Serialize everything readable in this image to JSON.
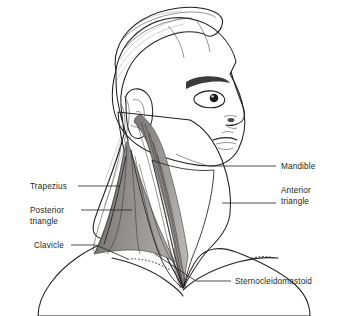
{
  "figure": {
    "orientation": "right lateral profile, facing right",
    "background_color": "#ffffff"
  },
  "palette": {
    "outline": "#231f20",
    "skin": "#eceae8",
    "skin_highlight": "#f7f6f5",
    "hair_mid": "#8a8a8a",
    "hair_dark": "#6e6e6e",
    "muscle_dark": "#5f5f5f",
    "muscle_mid": "#8d8d8d",
    "muscle_light": "#b5b3b1",
    "label_text": "#231f20"
  },
  "labels": [
    {
      "id": "trapezius",
      "text": "Trapezius",
      "side": "left",
      "lines": [
        "Trapezius"
      ],
      "text_x": 30,
      "text_y": 189,
      "leader": "M 78 186 L 120 186"
    },
    {
      "id": "posterior-triangle",
      "text": "Posterior triangle",
      "side": "left",
      "lines": [
        "Posterior",
        "triangle"
      ],
      "text_x": 30,
      "text_y": 213,
      "leader": "M 81 210 L 132 210"
    },
    {
      "id": "clavicle",
      "text": "Clavicle",
      "side": "left",
      "lines": [
        "Clavicle"
      ],
      "text_x": 34,
      "text_y": 248,
      "leader": "M 71 245 L 96 245 L 128 259"
    },
    {
      "id": "mandible",
      "text": "Mandible",
      "side": "right",
      "lines": [
        "Mandible"
      ],
      "text_x": 281,
      "text_y": 169,
      "leader": "M 209 166 L 276 166"
    },
    {
      "id": "anterior-triangle",
      "text": "Anterior triangle",
      "side": "right",
      "lines": [
        "Anterior",
        "triangle"
      ],
      "text_x": 281,
      "text_y": 193,
      "leader": "M 222 203 L 276 203"
    },
    {
      "id": "sternocleidomastoid",
      "text": "Sternocleidomastoid",
      "side": "right",
      "lines": [
        "Sternocleidomastoid"
      ],
      "text_x": 235,
      "text_y": 284,
      "leader": "M 155 254 L 196 281 L 231 281"
    }
  ],
  "anatomy_parts": [
    {
      "id": "hair",
      "name": "hair"
    },
    {
      "id": "face",
      "name": "face-profile"
    },
    {
      "id": "ear",
      "name": "ear"
    },
    {
      "id": "eye",
      "name": "eye"
    },
    {
      "id": "eyebrow",
      "name": "eyebrow"
    },
    {
      "id": "nose",
      "name": "nose"
    },
    {
      "id": "lips",
      "name": "lips"
    },
    {
      "id": "neck",
      "name": "neck"
    },
    {
      "id": "trapezius-muscle",
      "name": "trapezius-muscle"
    },
    {
      "id": "scm-muscle",
      "name": "sternocleidomastoid-muscle"
    },
    {
      "id": "clavicle-bone",
      "name": "clavicle-bone"
    },
    {
      "id": "torso",
      "name": "torso-shoulders"
    },
    {
      "id": "anterior-triangle-region",
      "name": "anterior-triangle-region"
    },
    {
      "id": "posterior-triangle-region",
      "name": "posterior-triangle-region"
    }
  ]
}
